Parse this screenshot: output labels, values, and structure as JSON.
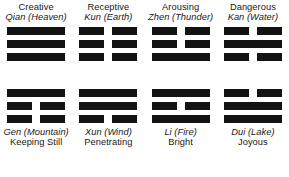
{
  "diagram": {
    "line_types": {
      "solid": "solid-yang-line",
      "broken": "broken-yin-line"
    },
    "colors": {
      "line": "#131313",
      "text": "#181818",
      "background": "#ffffff"
    },
    "top_row": [
      {
        "name": "Creative",
        "pinyin": "Qian (Heaven)",
        "lines": [
          "solid",
          "solid",
          "solid"
        ]
      },
      {
        "name": "Receptive",
        "pinyin": "Kun (Earth)",
        "lines": [
          "broken",
          "broken",
          "broken"
        ]
      },
      {
        "name": "Arousing",
        "pinyin": "Zhen (Thunder)",
        "lines": [
          "broken",
          "broken",
          "solid"
        ]
      },
      {
        "name": "Dangerous",
        "pinyin": "Kan (Water)",
        "lines": [
          "broken",
          "solid",
          "broken"
        ]
      }
    ],
    "bottom_row": [
      {
        "pinyin": "Gen (Mountain)",
        "attribute": "Keeping Still",
        "lines": [
          "solid",
          "broken",
          "broken"
        ]
      },
      {
        "pinyin": "Xun (Wind)",
        "attribute": "Penetrating",
        "lines": [
          "solid",
          "solid",
          "broken"
        ]
      },
      {
        "pinyin": "Li (Fire)",
        "attribute": "Bright",
        "lines": [
          "solid",
          "broken",
          "solid"
        ]
      },
      {
        "pinyin": "Dui (Lake)",
        "attribute": "Joyous",
        "lines": [
          "broken",
          "solid",
          "solid"
        ]
      }
    ]
  }
}
